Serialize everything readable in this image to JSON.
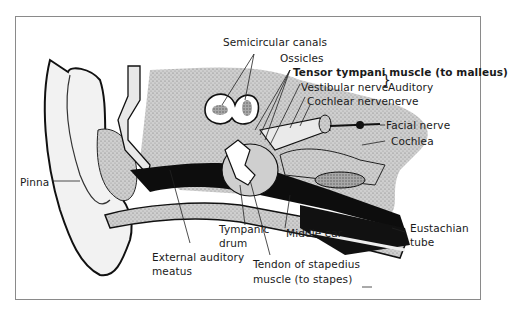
{
  "diagram": {
    "labels": {
      "semicircular_canals": "Semicircular canals",
      "ossicles": "Ossicles",
      "tensor_tympani": "Tensor tympani muscle (to malleus)",
      "vestibular_nerve": "Vestibular nerve",
      "cochlear_nerve": "Cochlear nerve",
      "auditory_nerve_line1": "Auditory",
      "auditory_nerve_line2": "nerve",
      "facial_nerve": "Facial nerve",
      "cochlea": "Cochlea",
      "pinna": "Pinna",
      "tympanic_drum_line1": "Tympanic",
      "tympanic_drum_line2": "drum",
      "middle_ear": "Middle ear",
      "external_auditory_meatus_line1": "External auditory",
      "external_auditory_meatus_line2": "meatus",
      "tendon_stapedius_line1": "Tendon of stapedius",
      "tendon_stapedius_line2": "muscle (to stapes)",
      "eustachian_tube_line1": "Eustachian",
      "eustachian_tube_line2": "tube"
    },
    "colors": {
      "ink": "#111111",
      "stipple": "#9a9a9a",
      "light_tissue": "#d8d8d8",
      "frame": "#8a8a8a"
    }
  }
}
